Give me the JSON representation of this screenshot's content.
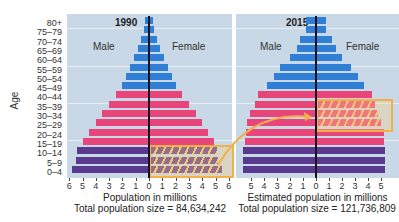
{
  "chart_data": [
    {
      "type": "bar",
      "subtype": "population-pyramid",
      "title": "1990",
      "categories": [
        "80+",
        "75–79",
        "70–74",
        "65–69",
        "60–64",
        "55–59",
        "50–54",
        "45–49",
        "40–44",
        "35–39",
        "30–34",
        "25–29",
        "20–24",
        "15–19",
        "10–14",
        "5–9",
        "0–4"
      ],
      "series": [
        {
          "name": "Male",
          "values": [
            0.3,
            0.4,
            0.6,
            0.8,
            1.1,
            1.4,
            1.7,
            2.0,
            2.5,
            3.0,
            3.5,
            4.0,
            4.5,
            5.0,
            5.4,
            5.5,
            5.8
          ]
        },
        {
          "name": "Female",
          "values": [
            0.3,
            0.4,
            0.6,
            0.8,
            1.1,
            1.4,
            1.7,
            2.0,
            2.5,
            3.0,
            3.5,
            4.0,
            4.4,
            4.9,
            5.1,
            5.2,
            5.5
          ]
        }
      ],
      "xlabel": "Population in millions",
      "ylabel": "Age",
      "xlim": [
        -6,
        6
      ],
      "x_ticks": [
        "6",
        "5",
        "4",
        "3",
        "2",
        "1",
        "0",
        "1",
        "2",
        "3",
        "4",
        "5",
        "6"
      ],
      "annotation": "Total population size = 84,634,242",
      "highlight": {
        "ages": [
          "0–4",
          "5–9",
          "10–14"
        ],
        "side": "Female"
      },
      "grid": true
    },
    {
      "type": "bar",
      "subtype": "population-pyramid",
      "title": "2015",
      "categories": [
        "80+",
        "75–79",
        "70–74",
        "65–69",
        "60–64",
        "55–59",
        "50–54",
        "45–49",
        "40–44",
        "35–39",
        "30–34",
        "25–29",
        "20–24",
        "15–19",
        "10–14",
        "5–9",
        "0–4"
      ],
      "series": [
        {
          "name": "Male",
          "values": [
            0.8,
            0.8,
            1.2,
            1.5,
            2.0,
            2.8,
            3.2,
            3.8,
            4.5,
            4.7,
            5.1,
            5.3,
            5.4,
            5.5,
            5.6,
            5.6,
            5.6
          ]
        },
        {
          "name": "Female",
          "values": [
            0.8,
            0.8,
            1.2,
            1.5,
            2.0,
            2.7,
            3.2,
            3.7,
            4.3,
            4.5,
            4.8,
            5.0,
            5.2,
            5.2,
            5.3,
            5.3,
            5.3
          ]
        }
      ],
      "xlabel": "Estimated population in millions",
      "ylabel": "Age",
      "xlim": [
        -6,
        6
      ],
      "x_ticks": [
        "5",
        "4",
        "3",
        "2",
        "1",
        "0",
        "1",
        "2",
        "3",
        "4",
        "5"
      ],
      "annotation": "Total population size = 121,736,809",
      "highlight": {
        "ages": [
          "25–29",
          "30–34",
          "35–39"
        ],
        "side": "Female"
      },
      "grid": true
    }
  ],
  "labels": {
    "age_axis": "Age",
    "male": "Male",
    "female": "Female",
    "year_1990": "1990",
    "year_2015": "2015",
    "xlabel_1990": "Population in millions",
    "total_1990": "Total population size = 84,634,242",
    "xlabel_2015": "Estimated population in millions",
    "total_2015": "Total population size = 121,736,809"
  },
  "colors": {
    "old": "#2f7fd6",
    "middle": "#e8457a",
    "young": "#5a3a8f",
    "highlight": "#f2b04a",
    "background": "#c9d8e6"
  }
}
